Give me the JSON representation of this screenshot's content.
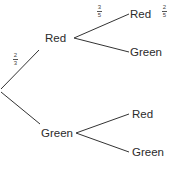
{
  "diagram": {
    "type": "probability-tree",
    "line_color": "#333333",
    "root": {
      "branches": [
        {
          "label": "Red",
          "probability": {
            "numerator": "2",
            "denominator": "3"
          },
          "branches": [
            {
              "label": "Red",
              "probability": {
                "numerator": "3",
                "denominator": "5"
              },
              "side_note": {
                "numerator": "2",
                "denominator": "5"
              }
            },
            {
              "label": "Green"
            }
          ]
        },
        {
          "label": "Green",
          "branches": [
            {
              "label": "Red"
            },
            {
              "label": "Green"
            }
          ]
        }
      ]
    }
  }
}
